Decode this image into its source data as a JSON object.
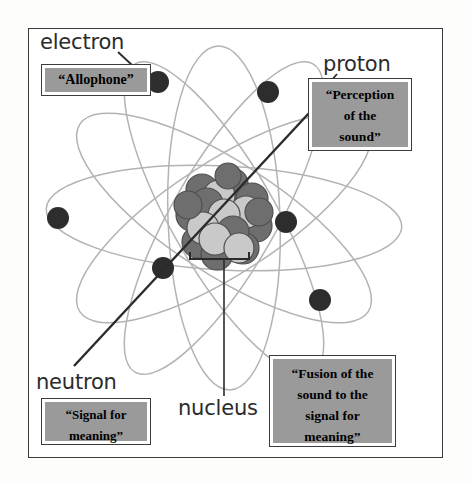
{
  "figure": {
    "background_color": "#ffffff",
    "frame_color": "#3a3a3a",
    "callout_fill_color": "#9a9a9a",
    "orbit_color": "#b3b3b3",
    "electron_color": "#2d2d2d",
    "nucleus_dark_color": "#6e6e6e",
    "nucleus_light_color": "#c9c9c9"
  },
  "labels": {
    "electron": "electron",
    "proton": "proton",
    "neutron": "neutron",
    "nucleus": "nucleus"
  },
  "callouts": {
    "allophone": {
      "lines": [
        "“Allophone”"
      ],
      "text": "“Allophone”",
      "points_to": "electron"
    },
    "perception": {
      "lines": [
        "“Perception",
        "of the",
        "sound”"
      ],
      "text": "“Perception of the sound”",
      "points_to": "proton"
    },
    "signal": {
      "lines": [
        "“Signal for",
        "meaning”"
      ],
      "text": "“Signal for meaning”",
      "points_to": "neutron"
    },
    "fusion": {
      "lines": [
        "“Fusion of the",
        "sound to the",
        "signal for",
        "meaning”"
      ],
      "text": "“Fusion of the sound to the signal for meaning”",
      "points_to": "nucleus"
    }
  },
  "atom": {
    "nucleus_center": {
      "x": 224,
      "y": 218
    },
    "electrons": [
      {
        "x": 158,
        "y": 82
      },
      {
        "x": 268,
        "y": 92
      },
      {
        "x": 58,
        "y": 218
      },
      {
        "x": 286,
        "y": 222
      },
      {
        "x": 163,
        "y": 268
      },
      {
        "x": 320,
        "y": 300
      }
    ],
    "orbit_count": 6,
    "nucleon_count": 19
  }
}
